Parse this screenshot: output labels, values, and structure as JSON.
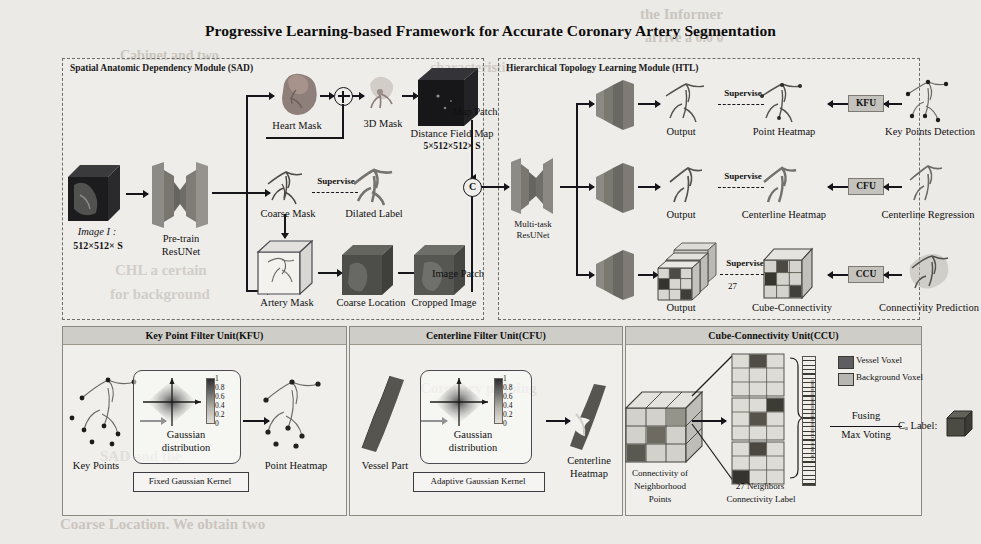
{
  "figure": {
    "title": "Progressive Learning-based Framework for Accurate Coronary Artery Segmentation",
    "background_color": "#eceae6",
    "ink_color": "#15151a"
  },
  "ghost_text": [
    "the Informer",
    "arrive a 0.0 0",
    "Cabinet and two",
    "characteristic",
    "CHL a certain",
    "for background",
    "Coronary probing",
    "SAD and the",
    "Coarse Location. We obtain two"
  ],
  "modules": {
    "sad": {
      "title": "Spatial Anatomic Dependency Module (SAD)",
      "input_label_line1": "Image I :",
      "input_label_line2": "512×512× S",
      "backbone_line1": "Pre-train",
      "backbone_line2": "ResUNet",
      "heart_mask": "Heart Mask",
      "mask_3d": "3D Mask",
      "distance_field_line1": "Distance Field Map",
      "distance_field_line2": "5×512×512× S",
      "map_patch": "Map Patch",
      "coarse_mask": "Coarse Mask",
      "dilated_label": "Dilated Label",
      "supervise": "Supervise",
      "artery_mask": "Artery Mask",
      "coarse_location": "Coarse Location",
      "cropped_image": "Cropped Image",
      "image_patch": "Image Patch"
    },
    "htl": {
      "title": "Hierarchical Topology Learning Module (HTL)",
      "concat_symbol": "C",
      "backbone_line1": "Multi-task",
      "backbone_line2": "ResUNet",
      "branches": [
        {
          "output": "Output",
          "supervise": "Supervise",
          "target": "Point Heatmap",
          "unit": "KFU",
          "source": "Key Points Detection"
        },
        {
          "output": "Output",
          "supervise": "Supervise",
          "target": "Centerline Heatmap",
          "unit": "CFU",
          "source": "Centerline Regression"
        },
        {
          "output": "Output",
          "supervise": "Supervise",
          "target": "Cube-Connectivity",
          "unit": "CCU",
          "source": "Connectivity Prediction",
          "stack_count": "27"
        }
      ]
    }
  },
  "units": {
    "kfu": {
      "title": "Key Point Filter Unit(KFU)",
      "input_label": "Key Points",
      "kernel_label_line1": "Gaussian",
      "kernel_label_line2": "distribution",
      "kernel_box": "Fixed Gaussian Kernel",
      "output_label": "Point Heatmap",
      "colorbar_ticks": [
        "1",
        "0.8",
        "0.6",
        "0.4",
        "0.2",
        "0"
      ]
    },
    "cfu": {
      "title": "Centerline Filter Unit(CFU)",
      "input_label": "Vessel Part",
      "kernel_label_line1": "Gaussian",
      "kernel_label_line2": "distribution",
      "kernel_box": "Adaptive Gaussian Kernel",
      "output_label_line1": "Centerline",
      "output_label_line2": "Heatmap",
      "colorbar_ticks": [
        "1",
        "0.8",
        "0.6",
        "0.4",
        "0.2",
        "0"
      ]
    },
    "ccu": {
      "title": "Cube-Connectivity Unit(CCU)",
      "input_label_line1": "Connectivity of",
      "input_label_line2": "Neighborhood",
      "input_label_line3": "Points",
      "neighbors_label_line1": "27 Neighbors",
      "neighbors_label_line2": "Connectivity Label",
      "legend": [
        {
          "swatch": "#5d5d62",
          "label": "Vessel Voxel"
        },
        {
          "swatch": "#b8b6b0",
          "label": "Background Voxel"
        }
      ],
      "fusing_line1": "Fusing",
      "fusing_line2": "Max Voting",
      "result_label": "Cₐ Label:",
      "connectivity_bits": "0100111010001010011010010011001010010010"
    }
  }
}
